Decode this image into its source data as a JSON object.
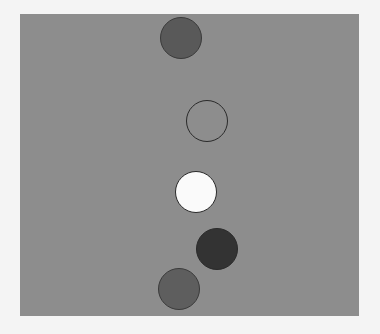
{
  "scene": {
    "background": "#f4f4f4",
    "panel": {
      "x": 20,
      "y": 14,
      "width": 339,
      "height": 302,
      "color": "#8d8d8d"
    },
    "circles": [
      {
        "id": "circle-1",
        "cx": 181,
        "cy": 38,
        "r": 21,
        "fill": "#595959",
        "stroke": "#3a3a3a"
      },
      {
        "id": "circle-2",
        "cx": 207,
        "cy": 121,
        "r": 21,
        "fill": "#8d8d8d",
        "stroke": "#2a2a2a"
      },
      {
        "id": "circle-3",
        "cx": 196,
        "cy": 192,
        "r": 21,
        "fill": "#fafafa",
        "stroke": "#2a2a2a"
      },
      {
        "id": "circle-4",
        "cx": 217,
        "cy": 249,
        "r": 21,
        "fill": "#333333",
        "stroke": "#2a2a2a"
      },
      {
        "id": "circle-5",
        "cx": 179,
        "cy": 289,
        "r": 21,
        "fill": "#5e5e5e",
        "stroke": "#3a3a3a"
      }
    ]
  }
}
